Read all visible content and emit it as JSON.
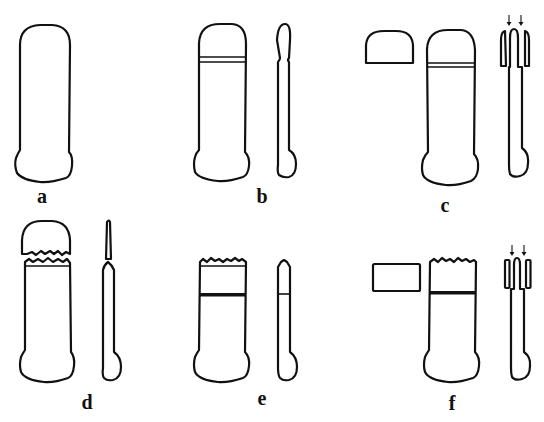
{
  "figure": {
    "type": "line-drawing",
    "colors": {
      "line": "#111111",
      "background": "#ffffff"
    }
  },
  "panels": [
    {
      "id": "a",
      "label": "a",
      "label_pos": [
        42,
        186
      ],
      "parts": [
        "front-body"
      ]
    },
    {
      "id": "b",
      "label": "b",
      "label_pos": [
        262,
        186
      ],
      "parts": [
        "front-body-with-band",
        "side-view-notched"
      ]
    },
    {
      "id": "c",
      "label": "c",
      "label_pos": [
        445,
        195
      ],
      "parts": [
        "detached-cap",
        "front-body-with-band",
        "side-view-forked"
      ],
      "arrows": 2
    },
    {
      "id": "d",
      "label": "d",
      "label_pos": [
        87,
        392
      ],
      "parts": [
        "fractured-cap",
        "fractured-body",
        "side-view-broken"
      ]
    },
    {
      "id": "e",
      "label": "e",
      "label_pos": [
        262,
        388
      ],
      "parts": [
        "fractured-body-with-dark-band",
        "side-view-pointed"
      ]
    },
    {
      "id": "f",
      "label": "f",
      "label_pos": [
        452,
        393
      ],
      "parts": [
        "rectangular-block",
        "fractured-body-with-dark-band",
        "side-view-forked"
      ],
      "arrows": 2
    }
  ]
}
